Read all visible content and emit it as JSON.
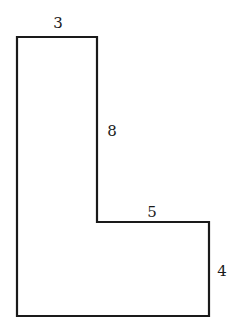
{
  "diagram": {
    "type": "L-shaped polygon",
    "stroke_color": "#1a1a1a",
    "background": "#ffffff",
    "vertices": [
      [
        17,
        37
      ],
      [
        97,
        37
      ],
      [
        97,
        222
      ],
      [
        209,
        222
      ],
      [
        209,
        316
      ],
      [
        17,
        316
      ]
    ],
    "labels": {
      "top_width": "3",
      "inner_vertical": "8",
      "inner_horizontal": "5",
      "right_height": "4"
    }
  }
}
